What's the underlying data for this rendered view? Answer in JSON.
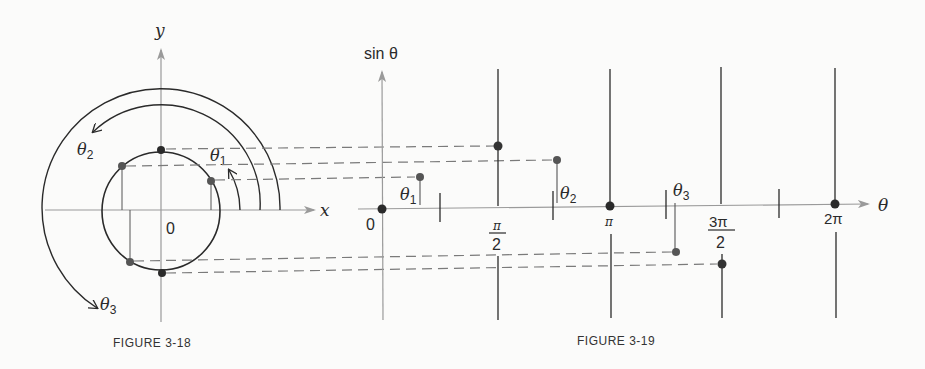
{
  "figure_3_18": {
    "caption": "FIGURE 3-18",
    "axis_x_label": "x",
    "axis_y_label": "y",
    "origin_label": "0",
    "angle_labels": {
      "theta1": "θ",
      "theta1_sub": "1",
      "theta2": "θ",
      "theta2_sub": "2",
      "theta3": "θ",
      "theta3_sub": "3"
    }
  },
  "figure_3_19": {
    "caption": "FIGURE 3-19",
    "axis_y_label": "sin θ",
    "axis_x_label": "θ",
    "origin_label": "0",
    "tick_labels": {
      "half_pi_num": "π",
      "half_pi_den": "2",
      "pi": "π",
      "three_half_pi_num": "3π",
      "three_half_pi_den": "2",
      "two_pi": "2π"
    },
    "angle_labels": {
      "theta1": "θ",
      "theta1_sub": "1",
      "theta2": "θ",
      "theta2_sub": "2",
      "theta3": "θ",
      "theta3_sub": "3"
    }
  },
  "colors": {
    "ink": "#2a2a2a",
    "axis": "#9a9a9a",
    "dash": "#7a7a7a",
    "background": "#fbfbfa"
  }
}
